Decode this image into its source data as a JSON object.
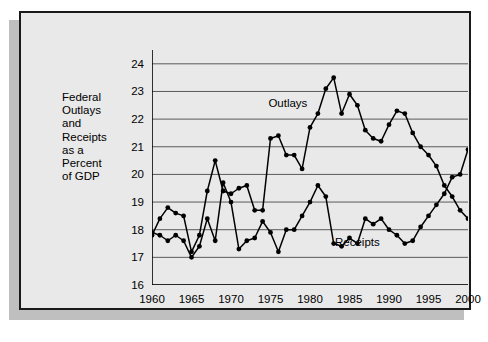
{
  "figure": {
    "y_axis_caption": "Federal\nOutlays\nand\nReceipts\nas a\nPercent\nof GDP",
    "background": "#e9e9e9",
    "frame_color": "#1a1a1a",
    "shadow_color": "#bfbfbf"
  },
  "chart_data": {
    "type": "line",
    "title": "",
    "xlabel": "",
    "ylabel": "Federal Outlays and Receipts as a Percent of GDP",
    "xlim": [
      1960,
      2000
    ],
    "ylim": [
      16,
      24.5
    ],
    "xticks": [
      1960,
      1965,
      1970,
      1975,
      1980,
      1985,
      1990,
      1995,
      2000
    ],
    "xtick_labels": [
      "1960",
      "1965",
      "1970",
      "1975",
      "1980",
      "1985",
      "1990",
      "1995",
      "2000"
    ],
    "yticks": [
      16,
      17,
      18,
      19,
      20,
      21,
      22,
      23,
      24
    ],
    "ytick_labels": [
      "16",
      "17",
      "18",
      "19",
      "20",
      "21",
      "22",
      "23",
      "24"
    ],
    "y_minor_tick_interval": 0.5,
    "grid": "horizontal",
    "grid_color": "#5a5a5a",
    "line_color": "#000000",
    "marker": "circle",
    "legend": "inline-annotations",
    "annotations": [
      {
        "text": "Outlays",
        "x": 1977.2,
        "y": 22.6
      },
      {
        "text": "Receipts",
        "x": 1986.0,
        "y": 17.55
      }
    ],
    "x": [
      1960,
      1961,
      1962,
      1963,
      1964,
      1965,
      1966,
      1967,
      1968,
      1969,
      1970,
      1971,
      1972,
      1973,
      1974,
      1975,
      1976,
      1977,
      1978,
      1979,
      1980,
      1981,
      1982,
      1983,
      1984,
      1985,
      1986,
      1987,
      1988,
      1989,
      1990,
      1991,
      1992,
      1993,
      1994,
      1995,
      1996,
      1997,
      1998,
      1999,
      2000
    ],
    "series": [
      {
        "name": "Outlays",
        "values": [
          17.8,
          18.4,
          18.8,
          18.6,
          18.5,
          17.2,
          17.8,
          19.4,
          20.5,
          19.4,
          19.3,
          19.5,
          19.6,
          18.7,
          18.7,
          21.3,
          21.4,
          20.7,
          20.7,
          20.2,
          21.7,
          22.2,
          23.1,
          23.5,
          22.2,
          22.9,
          22.5,
          21.6,
          21.3,
          21.2,
          21.8,
          22.3,
          22.2,
          21.5,
          21.0,
          20.7,
          20.3,
          19.6,
          19.2,
          18.7,
          18.4
        ]
      },
      {
        "name": "Receipts",
        "values": [
          17.9,
          17.8,
          17.6,
          17.8,
          17.6,
          17.0,
          17.4,
          18.4,
          17.6,
          19.7,
          19.0,
          17.3,
          17.6,
          17.7,
          18.3,
          17.9,
          17.2,
          18.0,
          18.0,
          18.5,
          19.0,
          19.6,
          19.2,
          17.5,
          17.4,
          17.7,
          17.5,
          18.4,
          18.2,
          18.4,
          18.0,
          17.8,
          17.5,
          17.6,
          18.1,
          18.5,
          18.9,
          19.3,
          19.9,
          20.0,
          20.9
        ]
      }
    ]
  }
}
